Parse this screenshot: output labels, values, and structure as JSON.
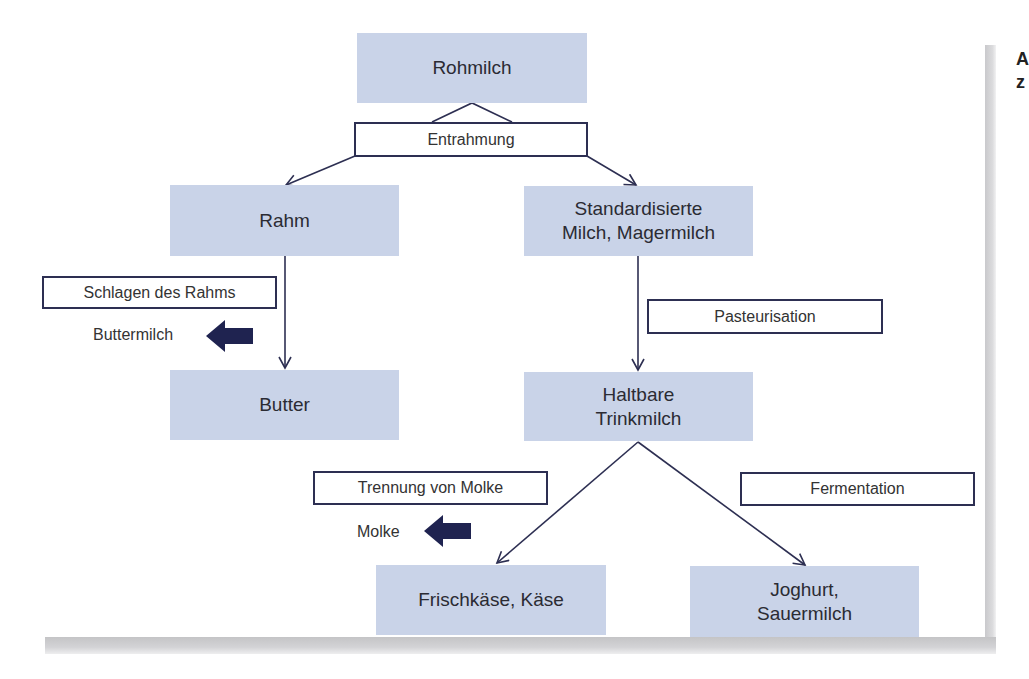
{
  "diagram": {
    "type": "flowchart",
    "colors": {
      "node_fill": "#c9d3e8",
      "line": "#2d2f52",
      "arrow_fill": "#1f2350",
      "text": "#2b2b33"
    },
    "nodes": {
      "rohmilch": "Rohmilch",
      "rahm": "Rahm",
      "standard_line1": "Standardisierte",
      "standard_line2": "Milch, Magermilch",
      "butter": "Butter",
      "haltbar_line1": "Haltbare",
      "haltbar_line2": "Trinkmilch",
      "frischkaese": "Frischkäse, Käse",
      "joghurt_line1": "Joghurt,",
      "joghurt_line2": "Sauermilch"
    },
    "processes": {
      "entrahmung": "Entrahmung",
      "schlagen": "Schlagen des Rahms",
      "pasteurisation": "Pasteurisation",
      "trennung": "Trennung von Molke",
      "fermentation": "Fermentation"
    },
    "byproducts": {
      "buttermilch": "Buttermilch",
      "molke": "Molke"
    },
    "edges": [
      {
        "from": "Rohmilch",
        "to": "Rahm",
        "via": "Entrahmung"
      },
      {
        "from": "Rohmilch",
        "to": "Standardisierte Milch, Magermilch",
        "via": "Entrahmung"
      },
      {
        "from": "Rahm",
        "to": "Butter",
        "via": "Schlagen des Rahms",
        "byproduct": "Buttermilch"
      },
      {
        "from": "Standardisierte Milch, Magermilch",
        "to": "Haltbare Trinkmilch",
        "via": "Pasteurisation"
      },
      {
        "from": "Haltbare Trinkmilch",
        "to": "Frischkäse, Käse",
        "via": "Trennung von Molke",
        "byproduct": "Molke"
      },
      {
        "from": "Haltbare Trinkmilch",
        "to": "Joghurt, Sauermilch",
        "via": "Fermentation"
      }
    ],
    "cropped_edge_text": [
      "A",
      "z"
    ]
  }
}
